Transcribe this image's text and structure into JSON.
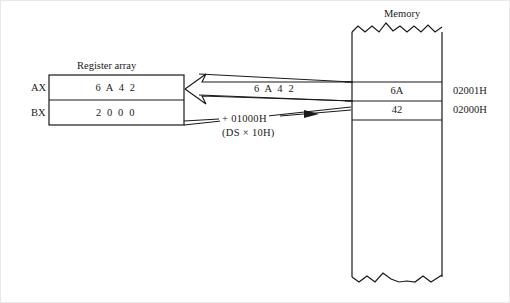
{
  "figure": {
    "background_color": "#ffffff",
    "line_color": "#1a1a1a"
  },
  "register_side": {
    "title": "Register array",
    "registers": [
      {
        "name": "AX",
        "label": "AX",
        "value": "6 A 4 2"
      },
      {
        "name": "BX",
        "label": "BX",
        "value": "2 0 0 0"
      }
    ]
  },
  "annotations": {
    "transfer_value": "6 A 4 2",
    "offset_add": "+ 01000H",
    "offset_note": "(DS × 10H)"
  },
  "memory_side": {
    "title": "Memory",
    "cells": [
      {
        "value": "6A",
        "address": "02001H"
      },
      {
        "value": "42",
        "address": "02000H"
      }
    ]
  }
}
